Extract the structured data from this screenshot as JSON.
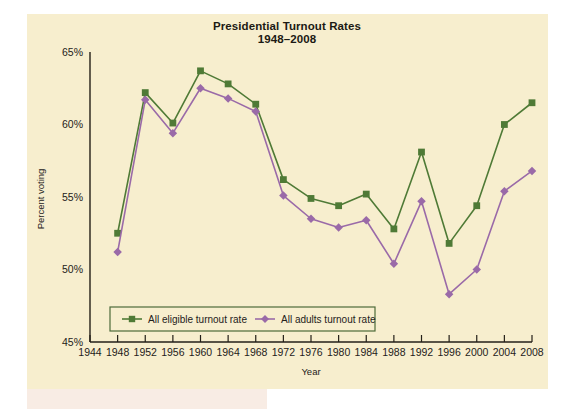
{
  "figure": {
    "title_line1": "Presidential Turnout Rates",
    "title_line2": "1948–2008",
    "background_color": "#f7eece"
  },
  "axes": {
    "x_label": "Year",
    "y_label": "Percent voting",
    "y_ticks": [
      "65%",
      "60%",
      "55%",
      "50%",
      "45%"
    ],
    "x_ticks": [
      "1944",
      "1948",
      "1952",
      "1956",
      "1960",
      "1964",
      "1968",
      "1972",
      "1976",
      "1980",
      "1984",
      "1988",
      "1992",
      "1996",
      "2000",
      "2004",
      "2008"
    ]
  },
  "legend": {
    "items": [
      {
        "label": "All eligible turnout rate",
        "color": "#4f7a36",
        "marker": "square"
      },
      {
        "label": "All adults turnout rate",
        "color": "#9a6aa8",
        "marker": "diamond"
      }
    ]
  },
  "chart_data": {
    "type": "line",
    "title": "Presidential Turnout Rates 1948–2008",
    "xlabel": "Year",
    "ylabel": "Percent voting",
    "xlim": [
      1944,
      2008
    ],
    "ylim": [
      45,
      65
    ],
    "ytick_values": [
      65,
      60,
      55,
      50,
      45
    ],
    "xtick_values": [
      1944,
      1948,
      1952,
      1956,
      1960,
      1964,
      1968,
      1972,
      1976,
      1980,
      1984,
      1988,
      1992,
      1996,
      2000,
      2004,
      2008
    ],
    "grid": false,
    "legend_position": "lower-left-inside",
    "x": [
      1948,
      1952,
      1956,
      1960,
      1964,
      1968,
      1972,
      1976,
      1980,
      1984,
      1988,
      1992,
      1996,
      2000,
      2004,
      2008
    ],
    "series": [
      {
        "name": "All eligible turnout rate",
        "color": "#4f7a36",
        "marker": "square",
        "values": [
          52.5,
          62.2,
          60.1,
          63.7,
          62.8,
          61.4,
          56.2,
          54.9,
          54.4,
          55.2,
          52.8,
          58.1,
          51.8,
          54.4,
          60.0,
          61.5
        ]
      },
      {
        "name": "All adults turnout rate",
        "color": "#9a6aa8",
        "marker": "diamond",
        "values": [
          51.2,
          61.7,
          59.4,
          62.5,
          61.8,
          60.9,
          55.1,
          53.5,
          52.9,
          53.4,
          50.4,
          54.7,
          48.3,
          50.0,
          55.4,
          56.8
        ]
      }
    ]
  }
}
